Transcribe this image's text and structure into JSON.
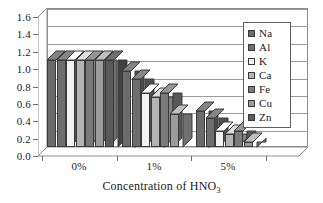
{
  "chart_data": {
    "type": "bar",
    "title": "",
    "xlabel": "Concentration of HNO3",
    "xlabel_rich": {
      "text": "Concentration of HNO",
      "subscript": "3"
    },
    "ylabel": "",
    "categories": [
      "0%",
      "1%",
      "5%"
    ],
    "ylim": [
      0.0,
      1.6
    ],
    "ytick_labels": [
      "0.0",
      "0.2",
      "0.4",
      "0.6",
      "0.8",
      "1.0",
      "1.2",
      "1.4",
      "1.6"
    ],
    "ytick_values": [
      0.0,
      0.2,
      0.4,
      0.6,
      0.8,
      1.0,
      1.2,
      1.4,
      1.6
    ],
    "grid": true,
    "legend_position": "top-right",
    "style": "3d-clustered-column",
    "series": [
      {
        "name": "Na",
        "color": "#6b6b6b",
        "values": [
          1.0,
          0.88,
          0.42
        ]
      },
      {
        "name": "Al",
        "color": "#6e6e6e",
        "values": [
          1.0,
          0.78,
          0.33
        ]
      },
      {
        "name": "K",
        "color": "#f2f2f2",
        "values": [
          1.0,
          0.62,
          0.18
        ]
      },
      {
        "name": "Ca",
        "color": "#b4b4b4",
        "values": [
          1.0,
          0.58,
          0.15
        ]
      },
      {
        "name": "Fe",
        "color": "#7a7a7a",
        "values": [
          1.0,
          0.62,
          0.18
        ]
      },
      {
        "name": "Cu",
        "color": "#9c9c9c",
        "values": [
          1.0,
          0.38,
          0.06
        ]
      },
      {
        "name": "Zn",
        "color": "#5a5a5a",
        "values": [
          1.0,
          null,
          null
        ]
      }
    ]
  },
  "legend": {
    "items": [
      {
        "label": "Na"
      },
      {
        "label": "Al"
      },
      {
        "label": "K"
      },
      {
        "label": "Ca"
      },
      {
        "label": "Fe"
      },
      {
        "label": "Cu"
      },
      {
        "label": "Zn"
      }
    ]
  },
  "colors": {
    "axis": "#6e6e6e",
    "grid": "#9a9a9a",
    "frame": "#8d8d8d",
    "text": "#1a1a1a",
    "background": "#ffffff",
    "wall_3d": "#e6e6e6"
  }
}
